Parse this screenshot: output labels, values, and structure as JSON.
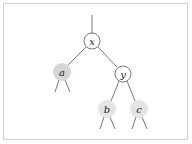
{
  "diagram": {
    "type": "binary-tree",
    "colors": {
      "edge": "#555555",
      "light_node": "#ffffff",
      "shaded_node": "#e4e4e4",
      "dark_shaded_node": "#d6d6d6"
    },
    "nodes": [
      {
        "id": "x",
        "label": "x",
        "cx": 92,
        "cy": 41,
        "fill": "#ffffff"
      },
      {
        "id": "a",
        "label": "a",
        "cx": 62,
        "cy": 72,
        "fill": "#d6d6d6"
      },
      {
        "id": "y",
        "label": "y",
        "cx": 123,
        "cy": 74,
        "fill": "#ffffff"
      },
      {
        "id": "b",
        "label": "b",
        "cx": 107,
        "cy": 109,
        "fill": "#e4e4e4"
      },
      {
        "id": "c",
        "label": "c",
        "cx": 139,
        "cy": 109,
        "fill": "#e4e4e4"
      }
    ]
  }
}
